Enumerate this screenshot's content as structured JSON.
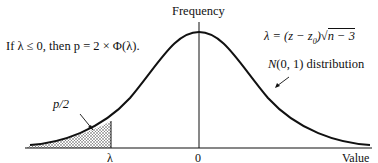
{
  "diagram": {
    "y_axis_label": "Frequency",
    "x_axis_label": "Value",
    "x_ticks": [
      {
        "label": "λ",
        "x": 111
      },
      {
        "label": "0",
        "x": 199
      }
    ],
    "rule_text": "If λ ≤ 0, then p = 2 × Φ(λ).",
    "formula_text": "λ = (z − z₀)√(n − 3)",
    "formula_parts": {
      "lhs": "λ = (z − z",
      "sub": "0",
      "mid": ")",
      "radical": "√",
      "radicand": "n − 3"
    },
    "curve_label": "N(0, 1) distribution",
    "curve_label_parts": {
      "n": "N",
      "rest": "(0, 1) distribution"
    },
    "shaded_label": "p/2",
    "curve": "standard normal density",
    "shaded_region": "left tail below λ",
    "colors": {
      "ink": "#111111",
      "shade": "#bdbdbd",
      "background": "#ffffff"
    }
  }
}
